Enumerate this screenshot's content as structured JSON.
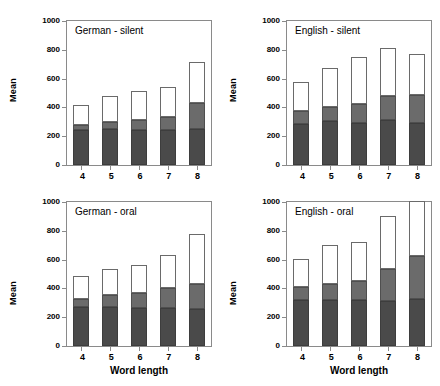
{
  "colors": {
    "segment_bottom": "#4a4a4a",
    "segment_middle": "#6b6b6b",
    "segment_top": "#ffffff",
    "frame": "#8a8a8a",
    "background": "#ffffff"
  },
  "chart_data": {
    "type": "bar",
    "layout": "2x2 panel grid of stacked bar charts",
    "stacked": true,
    "categories": [
      "4",
      "5",
      "6",
      "7",
      "8"
    ],
    "xlabel": "Word length",
    "ylabel": "Mean",
    "ylim": [
      0,
      1000
    ],
    "yticks": [
      0,
      200,
      400,
      600,
      800,
      1000
    ],
    "ytick_labels": [
      "0",
      "200",
      "400",
      "600",
      "800",
      "1000"
    ],
    "grid": false,
    "legend": "none",
    "series_names": [
      "bottom segment",
      "middle segment",
      "top segment"
    ],
    "panels": [
      {
        "id": "german-silent",
        "title": "German - silent",
        "position": "top-left",
        "show_xlabel": false,
        "series": [
          {
            "name": "bottom segment",
            "values": [
              245,
              248,
              245,
              240,
              248
            ]
          },
          {
            "name": "middle segment",
            "values": [
              35,
              50,
              70,
              95,
              185
            ]
          },
          {
            "name": "top segment",
            "values": [
              140,
              180,
              200,
              210,
              280
            ]
          }
        ],
        "cumulative_bottom": [
          245,
          248,
          245,
          240,
          248
        ],
        "cumulative_middle": [
          280,
          298,
          315,
          335,
          433
        ],
        "totals": [
          420,
          478,
          515,
          545,
          713
        ]
      },
      {
        "id": "english-silent",
        "title": "English - silent",
        "position": "top-right",
        "show_xlabel": false,
        "series": [
          {
            "name": "bottom segment",
            "values": [
              288,
              305,
              295,
              312,
              292
            ]
          },
          {
            "name": "middle segment",
            "values": [
              84,
              98,
              130,
              168,
              192
            ]
          },
          {
            "name": "top segment",
            "values": [
              203,
              270,
              325,
              333,
              290
            ]
          }
        ],
        "cumulative_bottom": [
          288,
          305,
          295,
          312,
          292
        ],
        "cumulative_middle": [
          372,
          403,
          425,
          480,
          484
        ],
        "totals": [
          575,
          673,
          750,
          813,
          774
        ]
      },
      {
        "id": "german-oral",
        "title": "German - oral",
        "position": "bottom-left",
        "show_xlabel": true,
        "series": [
          {
            "name": "bottom segment",
            "values": [
              270,
              268,
              267,
              262,
              260
            ]
          },
          {
            "name": "middle segment",
            "values": [
              58,
              85,
              103,
              138,
              172
            ]
          },
          {
            "name": "top segment",
            "values": [
              155,
              180,
              192,
              232,
              348
            ]
          }
        ],
        "cumulative_bottom": [
          270,
          268,
          267,
          262,
          260
        ],
        "cumulative_middle": [
          328,
          353,
          370,
          400,
          432
        ],
        "totals": [
          483,
          533,
          562,
          632,
          780
        ]
      },
      {
        "id": "english-oral",
        "title": "English - oral",
        "position": "bottom-right",
        "show_xlabel": true,
        "series": [
          {
            "name": "bottom segment",
            "values": [
              322,
              318,
              318,
              315,
              325
            ]
          },
          {
            "name": "middle segment",
            "values": [
              88,
              112,
              135,
              220,
              297
            ]
          },
          {
            "name": "top segment",
            "values": [
              195,
              275,
              272,
              368,
              385
            ]
          }
        ],
        "cumulative_bottom": [
          322,
          318,
          318,
          315,
          325
        ],
        "cumulative_middle": [
          410,
          430,
          453,
          535,
          622
        ],
        "totals": [
          605,
          705,
          725,
          903,
          1007
        ]
      }
    ]
  }
}
